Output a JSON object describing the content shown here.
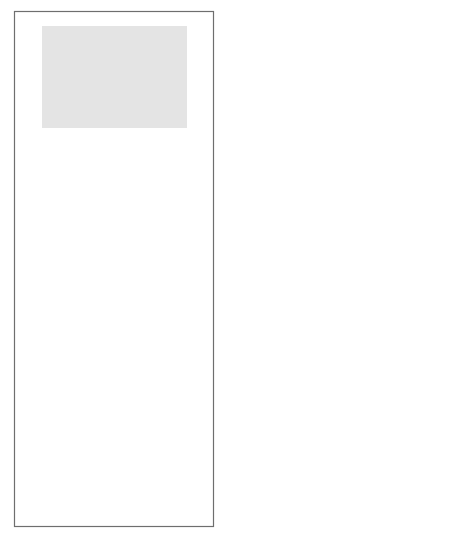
{
  "diagram": {
    "colors": {
      "hr_region": "#e4e4e4",
      "software_region": "#c6c6c6",
      "planning_region": "#eaeaea",
      "control_region": "#a9a9a9",
      "arrow": "#8a8a8a",
      "text": "#3a3a3a",
      "title_text": "#141414"
    },
    "regions": {
      "hr": "Human resources management",
      "hr_line1": "Human resources",
      "hr_line2": "management",
      "software_line1": "Software",
      "software_line2": "production",
      "planning": "Planning",
      "control": "Control"
    },
    "nodes": {
      "hiring_rate": [
        "Hiring",
        "rate"
      ],
      "turnover_rate": [
        "Turnover",
        "rate"
      ],
      "workforce": [
        "Workforce"
      ],
      "experience_mix": [
        "Experience",
        "mix"
      ],
      "qa_effort": [
        "QA effort"
      ],
      "process_losses": [
        "Process",
        "losses"
      ],
      "potential_productivity": [
        "Potential",
        "productivity"
      ],
      "error_detection": [
        "Error",
        "detection &",
        "correction"
      ],
      "software_dev_rate": [
        "Software",
        "development",
        "rate"
      ],
      "actual_productivity": [
        "Actual",
        "productivity"
      ],
      "error_rate": [
        "Error",
        "rate"
      ],
      "learning": [
        "Learning"
      ],
      "perceived_productivity": [
        "Perceived",
        "productivity"
      ],
      "schedule_pressure": [
        "Schedule",
        "pressure"
      ],
      "forecast_completion": [
        "Forecast",
        "completion",
        "date"
      ],
      "project_tasks": [
        "Project tasks",
        "perceived",
        "completed"
      ],
      "scheduled_completion": [
        "Scheduled",
        "completion",
        "date"
      ],
      "accuracy": [
        "Accuracy",
        "in progress",
        "measurement"
      ],
      "effort_needed": [
        "Effort",
        "perceived",
        "still needed"
      ],
      "perceived_workforce": [
        "Perceived",
        "workforce",
        "level needed"
      ],
      "perceived_project_size": [
        "Perceived",
        "project size"
      ],
      "workforce_adjustments": [
        "Workforce",
        "& schedule",
        "adjustments"
      ]
    },
    "caption": "Source: Abdel-Hamid (1991); Abdel-Hamid and Madnick (1989)",
    "right_margin_glyph": "F"
  }
}
